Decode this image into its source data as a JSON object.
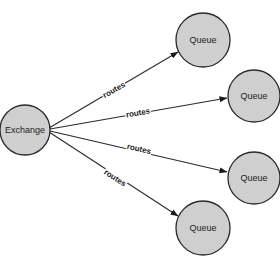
{
  "diagram": {
    "type": "message-routing",
    "colors": {
      "node_fill": "#cfcfcf",
      "stroke": "#2a2a2a",
      "background": "#ffffff"
    },
    "nodes": [
      {
        "id": "exchange",
        "label": "Exchange",
        "cx": 25,
        "cy": 130,
        "r": 25
      },
      {
        "id": "queue1",
        "label": "Queue",
        "cx": 203,
        "cy": 40,
        "r": 27
      },
      {
        "id": "queue2",
        "label": "Queue",
        "cx": 254,
        "cy": 96,
        "r": 26
      },
      {
        "id": "queue3",
        "label": "Queue",
        "cx": 254,
        "cy": 178,
        "r": 26
      },
      {
        "id": "queue4",
        "label": "Queue",
        "cx": 203,
        "cy": 228,
        "r": 27
      }
    ],
    "edges": [
      {
        "from": "exchange",
        "to": "queue1",
        "label": "routes"
      },
      {
        "from": "exchange",
        "to": "queue2",
        "label": "routes"
      },
      {
        "from": "exchange",
        "to": "queue3",
        "label": "routes"
      },
      {
        "from": "exchange",
        "to": "queue4",
        "label": "routes"
      }
    ]
  }
}
